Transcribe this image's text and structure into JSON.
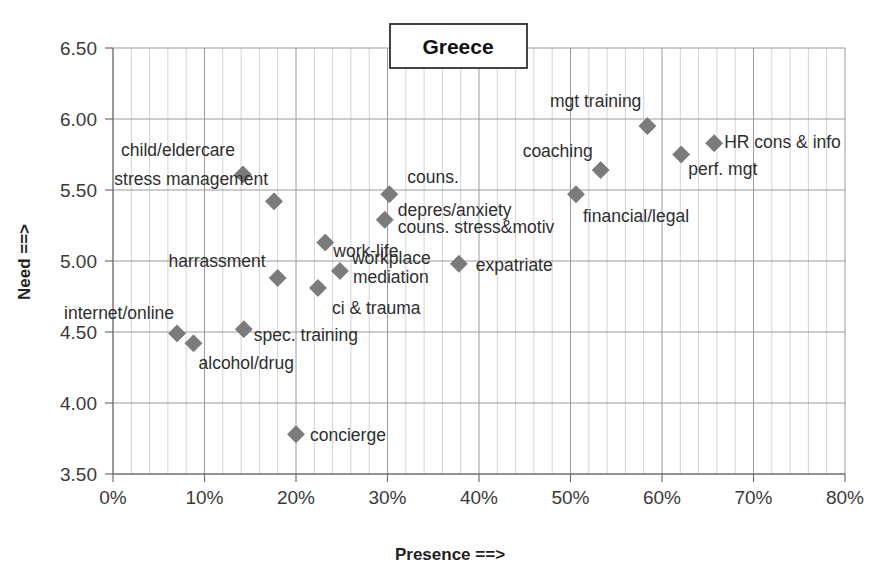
{
  "chart_data": {
    "type": "scatter",
    "title": "Greece",
    "xlabel": "Presence ==>",
    "ylabel": "Need ==>",
    "xlim": [
      0,
      80
    ],
    "ylim": [
      3.5,
      6.5
    ],
    "x_tick_labels": [
      "0%",
      "10%",
      "20%",
      "30%",
      "40%",
      "50%",
      "60%",
      "70%",
      "80%"
    ],
    "x_tick_values": [
      0,
      10,
      20,
      30,
      40,
      50,
      60,
      70,
      80
    ],
    "y_tick_labels": [
      "3.50",
      "4.00",
      "4.50",
      "5.00",
      "5.50",
      "6.00",
      "6.50"
    ],
    "y_tick_values": [
      3.5,
      4.0,
      4.5,
      5.0,
      5.5,
      6.0,
      6.5
    ],
    "grid": "major horizontal and minor vertical gridlines",
    "legend": "none",
    "marker_color": "#7b7b7b",
    "marker_shape": "diamond",
    "points": [
      {
        "label": "internet/online",
        "x": 7.0,
        "y": 4.49,
        "label_dx": -3,
        "label_dy": -14,
        "anchor": "end"
      },
      {
        "label": "alcohol/drug",
        "x": 8.8,
        "y": 4.42,
        "label_dx": 5,
        "label_dy": 26,
        "anchor": "start"
      },
      {
        "label": "child/eldercare",
        "x": 14.2,
        "y": 5.61,
        "label_dx": -8,
        "label_dy": -18,
        "anchor": "end"
      },
      {
        "label": "spec. training",
        "x": 14.3,
        "y": 4.52,
        "label_dx": 10,
        "label_dy": 12,
        "anchor": "start"
      },
      {
        "label": "stress management",
        "x": 17.6,
        "y": 5.42,
        "label_dx": -6,
        "label_dy": -16,
        "anchor": "end"
      },
      {
        "label": "harrassment",
        "x": 18.0,
        "y": 4.88,
        "label_dx": -12,
        "label_dy": -11,
        "anchor": "end"
      },
      {
        "label": "concierge",
        "x": 20.0,
        "y": 3.78,
        "label_dx": 14,
        "label_dy": 7,
        "anchor": "start"
      },
      {
        "label": "ci & trauma",
        "x": 22.4,
        "y": 4.81,
        "label_dx": 14,
        "label_dy": 26,
        "anchor": "start"
      },
      {
        "label": "work-life",
        "x": 23.2,
        "y": 5.13,
        "label_dx": 8,
        "label_dy": 14,
        "anchor": "start"
      },
      {
        "label": "mediation",
        "x": 24.8,
        "y": 4.93,
        "label_dx": 13,
        "label_dy": 12,
        "anchor": "start"
      },
      {
        "label": "workplace",
        "x": 24.8,
        "y": 4.93,
        "label_dx": 12,
        "label_dy": -7,
        "anchor": "start"
      },
      {
        "label": "depres/anxiety",
        "x": 29.7,
        "y": 5.29,
        "label_dx": 13,
        "label_dy": -4,
        "anchor": "start"
      },
      {
        "label": "couns. stress&motiv",
        "x": 29.7,
        "y": 5.29,
        "label_dx": 13,
        "label_dy": 13,
        "anchor": "start"
      },
      {
        "label": "couns.",
        "x": 30.2,
        "y": 5.47,
        "label_dx": 18,
        "label_dy": -11,
        "anchor": "start"
      },
      {
        "label": "expatriate",
        "x": 37.8,
        "y": 4.98,
        "label_dx": 17,
        "label_dy": 7,
        "anchor": "start"
      },
      {
        "label": "financial/legal",
        "x": 50.6,
        "y": 5.47,
        "label_dx": 7,
        "label_dy": 28,
        "anchor": "start"
      },
      {
        "label": "coaching",
        "x": 53.3,
        "y": 5.64,
        "label_dx": -8,
        "label_dy": -13,
        "anchor": "end"
      },
      {
        "label": "mgt training",
        "x": 58.4,
        "y": 5.95,
        "label_dx": -6,
        "label_dy": -19,
        "anchor": "end"
      },
      {
        "label": "perf. mgt",
        "x": 62.1,
        "y": 5.75,
        "label_dx": 7,
        "label_dy": 20,
        "anchor": "start"
      },
      {
        "label": "HR cons & info",
        "x": 65.7,
        "y": 5.83,
        "label_dx": 10,
        "label_dy": 5,
        "anchor": "start"
      }
    ]
  }
}
